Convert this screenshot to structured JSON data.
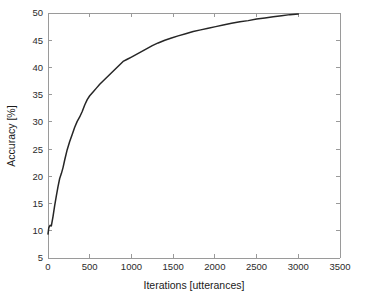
{
  "chart_data": {
    "type": "line",
    "title": "",
    "xlabel": "Iterations [utterances]",
    "ylabel": "Accuracy [%]",
    "xlim": [
      0,
      3500
    ],
    "ylim": [
      5,
      50
    ],
    "xticks": [
      0,
      500,
      1000,
      1500,
      2000,
      2500,
      3000,
      3500
    ],
    "xticklabels": [
      "0",
      "500",
      "1000",
      "1500",
      "2000",
      "2500",
      "3000",
      "3500"
    ],
    "yticks": [
      5,
      10,
      15,
      20,
      25,
      30,
      35,
      40,
      45,
      50
    ],
    "yticklabels": [
      "5",
      "10",
      "15",
      "20",
      "25",
      "30",
      "35",
      "40",
      "45",
      "50"
    ],
    "grid": false,
    "legend": null,
    "legend_position": "none",
    "line_color": "#262626",
    "axis_color": "#9a9a9a",
    "background_color": "#ffffff",
    "series": [
      {
        "name": "accuracy",
        "x": [
          0,
          10,
          25,
          40,
          60,
          80,
          100,
          120,
          140,
          160,
          180,
          200,
          230,
          260,
          290,
          320,
          350,
          380,
          410,
          440,
          470,
          500,
          540,
          580,
          620,
          660,
          700,
          740,
          780,
          820,
          860,
          900,
          950,
          1000,
          1060,
          1120,
          1180,
          1250,
          1320,
          1400,
          1480,
          1560,
          1650,
          1740,
          1830,
          1920,
          2010,
          2100,
          2200,
          2300,
          2400,
          2500,
          2600,
          2700,
          2800,
          2900,
          3000
        ],
        "y": [
          9.4,
          10.6,
          11.0,
          10.9,
          12.6,
          14.6,
          16.4,
          18.1,
          19.6,
          20.5,
          21.6,
          23.0,
          24.9,
          26.4,
          27.7,
          29.0,
          30.1,
          30.9,
          31.9,
          33.1,
          34.1,
          34.8,
          35.5,
          36.2,
          36.9,
          37.5,
          38.1,
          38.7,
          39.3,
          39.9,
          40.5,
          41.1,
          41.5,
          41.9,
          42.4,
          42.9,
          43.4,
          44.0,
          44.5,
          45.0,
          45.4,
          45.8,
          46.2,
          46.6,
          46.9,
          47.2,
          47.5,
          47.8,
          48.1,
          48.4,
          48.6,
          48.9,
          49.1,
          49.3,
          49.5,
          49.7,
          49.8
        ]
      }
    ]
  },
  "figure": {
    "xlabel_text": "Iterations [utterances]",
    "ylabel_text": "Accuracy [%]"
  }
}
